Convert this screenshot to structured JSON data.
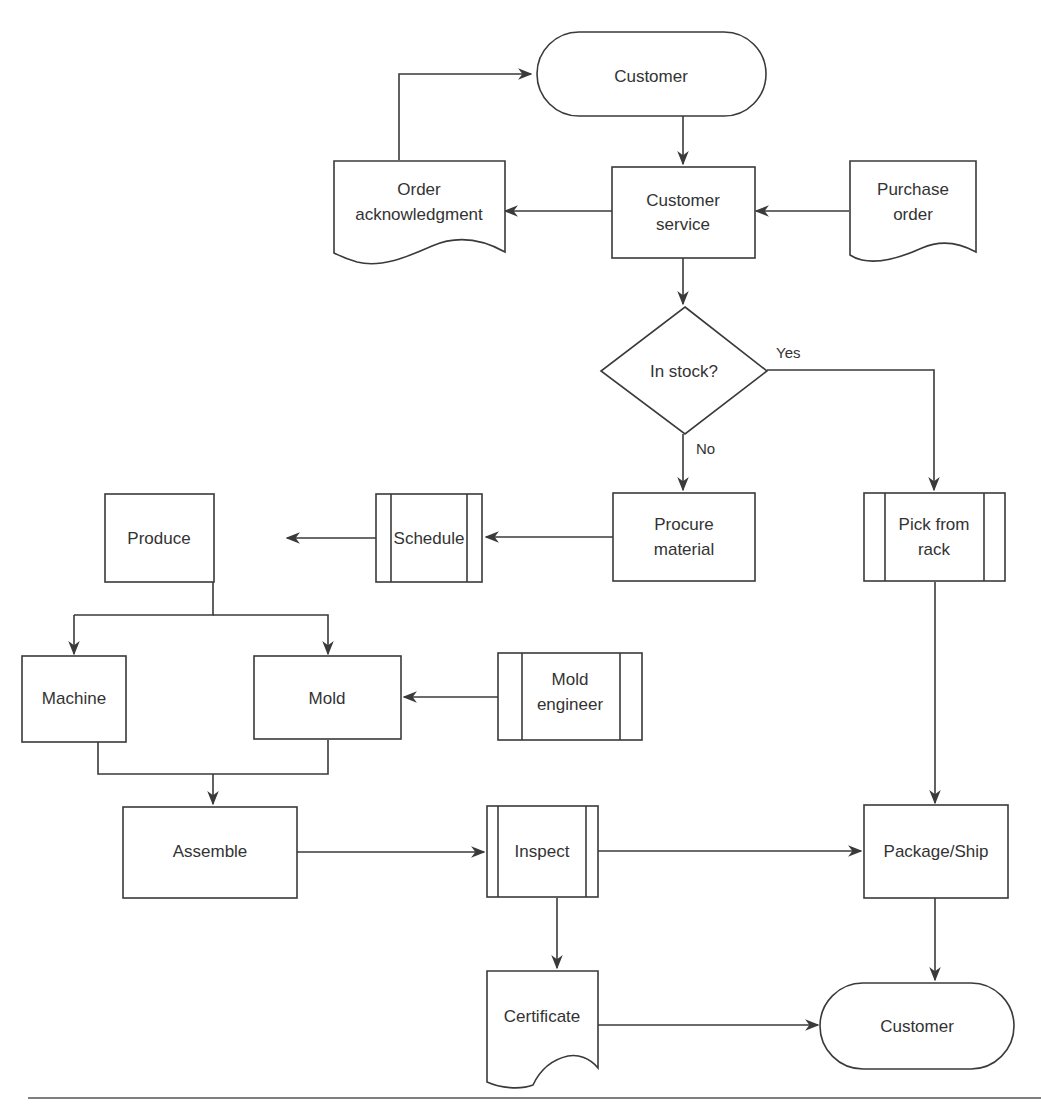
{
  "diagram": {
    "type": "flowchart",
    "nodes": {
      "customer_top": {
        "label": "Customer",
        "shape": "terminator"
      },
      "customer_service": {
        "lines": [
          "Customer",
          "service"
        ],
        "shape": "process"
      },
      "order_ack": {
        "lines": [
          "Order",
          "acknowledgment"
        ],
        "shape": "document"
      },
      "purchase_order": {
        "lines": [
          "Purchase",
          "order"
        ],
        "shape": "document"
      },
      "in_stock": {
        "label": "In stock?",
        "shape": "decision"
      },
      "procure": {
        "lines": [
          "Procure",
          "material"
        ],
        "shape": "process"
      },
      "schedule": {
        "label": "Schedule",
        "shape": "predefined-process"
      },
      "produce": {
        "label": "Produce",
        "shape": "process"
      },
      "pick_rack": {
        "lines": [
          "Pick from",
          "rack"
        ],
        "shape": "predefined-process"
      },
      "machine": {
        "label": "Machine",
        "shape": "process"
      },
      "mold": {
        "label": "Mold",
        "shape": "process"
      },
      "mold_engineer": {
        "lines": [
          "Mold",
          "engineer"
        ],
        "shape": "predefined-process"
      },
      "assemble": {
        "label": "Assemble",
        "shape": "process"
      },
      "inspect": {
        "label": "Inspect",
        "shape": "predefined-process"
      },
      "package_ship": {
        "label": "Package/Ship",
        "shape": "process"
      },
      "certificate": {
        "label": "Certificate",
        "shape": "document"
      },
      "customer_bottom": {
        "label": "Customer",
        "shape": "terminator"
      }
    },
    "edge_labels": {
      "yes": "Yes",
      "no": "No"
    },
    "edges": [
      {
        "from": "customer_top",
        "to": "customer_service"
      },
      {
        "from": "purchase_order",
        "to": "customer_service"
      },
      {
        "from": "customer_service",
        "to": "order_ack"
      },
      {
        "from": "order_ack",
        "to": "customer_top"
      },
      {
        "from": "customer_service",
        "to": "in_stock"
      },
      {
        "from": "in_stock",
        "to": "pick_rack",
        "label": "Yes"
      },
      {
        "from": "in_stock",
        "to": "procure",
        "label": "No"
      },
      {
        "from": "procure",
        "to": "schedule"
      },
      {
        "from": "schedule",
        "to": "produce"
      },
      {
        "from": "produce",
        "to": "machine"
      },
      {
        "from": "produce",
        "to": "mold"
      },
      {
        "from": "mold_engineer",
        "to": "mold"
      },
      {
        "from": "machine",
        "to": "assemble"
      },
      {
        "from": "mold",
        "to": "assemble"
      },
      {
        "from": "assemble",
        "to": "inspect"
      },
      {
        "from": "inspect",
        "to": "package_ship"
      },
      {
        "from": "inspect",
        "to": "certificate"
      },
      {
        "from": "pick_rack",
        "to": "package_ship"
      },
      {
        "from": "package_ship",
        "to": "customer_bottom"
      },
      {
        "from": "certificate",
        "to": "customer_bottom"
      }
    ]
  },
  "caption": {
    "note": "Figure caption is cropped at bottom edge of image; text not legible"
  }
}
